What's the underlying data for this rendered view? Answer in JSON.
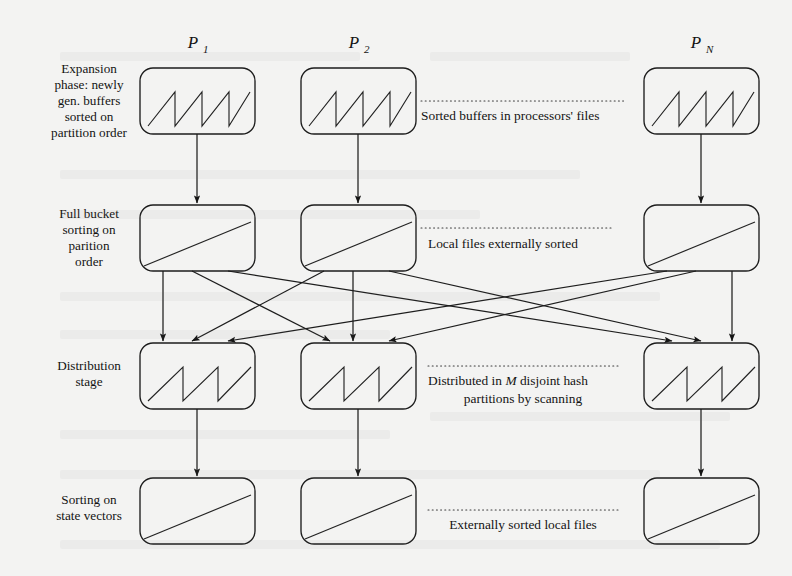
{
  "figure": {
    "type": "flow-diagram",
    "background_color": "#f3f3f2",
    "ink_color": "#1d1d1d"
  },
  "columns": [
    {
      "id": "p1",
      "header": "P",
      "subscript": "1",
      "label": "P1",
      "center_x": 197
    },
    {
      "id": "p2",
      "header": "P",
      "subscript": "2",
      "label": "P2",
      "center_x": 358
    },
    {
      "id": "pn",
      "header": "P",
      "subscript": "N",
      "label": "PN",
      "center_x": 701
    }
  ],
  "rows": [
    {
      "id": "expansion",
      "stage_label": [
        "Expansion",
        "phase: newly",
        "gen. buffers",
        "sorted on",
        "partition order"
      ],
      "box_glyph": "sawtooth-4",
      "annotation": {
        "lines": [
          "Sorted buffers in processors' files"
        ],
        "align": "start"
      }
    },
    {
      "id": "full-bucket",
      "stage_label": [
        "Full bucket",
        "sorting on",
        "parition",
        "order"
      ],
      "box_glyph": "diagonal",
      "annotation": {
        "lines": [
          "Local files externally sorted"
        ],
        "align": "start"
      }
    },
    {
      "id": "distribution",
      "stage_label": [
        "Distribution",
        "stage"
      ],
      "box_glyph": "sawtooth-3",
      "annotation": {
        "lines": [
          "Distributed in M disjoint hash",
          "partitions by scanning"
        ],
        "align": "center",
        "italic_token": "M"
      }
    },
    {
      "id": "state-vectors",
      "stage_label": [
        "Sorting on",
        "state vectors"
      ],
      "box_glyph": "diagonal",
      "annotation": {
        "lines": [
          "Externally sorted local files"
        ],
        "align": "center"
      }
    }
  ],
  "connections": {
    "straight_down": [
      {
        "from": "expansion",
        "to": "full-bucket",
        "columns": [
          "p1",
          "p2",
          "pn"
        ]
      },
      {
        "from": "distribution",
        "to": "state-vectors",
        "columns": [
          "p1",
          "p2",
          "pn"
        ]
      }
    ],
    "all_to_all": {
      "from": "full-bucket",
      "to": "distribution",
      "description": "each processor's sorted local file is split and sent to every processor's distribution stage",
      "edge_count": 9
    }
  },
  "annotations_order": [
    "Sorted buffers in processors' files",
    "Local files externally sorted",
    "Distributed in M disjoint hash partitions by scanning",
    "Externally sorted local files"
  ]
}
